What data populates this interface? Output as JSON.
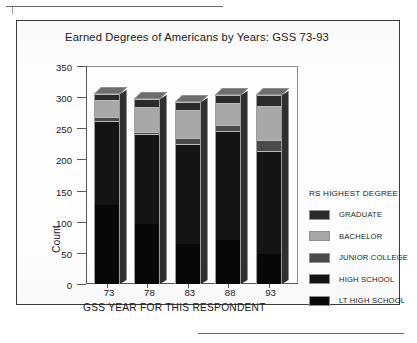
{
  "page": {
    "rules": {
      "top_rule": "horizontal-rule",
      "bottom_rule": "horizontal-rule"
    }
  },
  "figure": {
    "frame": "chart-frame"
  },
  "chart_data": {
    "type": "bar",
    "subtype": "stacked-vertical-3d",
    "title": "Earned Degrees of Americans by Years: GSS 73-93",
    "xlabel": "GSS YEAR FOR THIS RESPONDENT",
    "ylabel": "Count",
    "categories": [
      "73",
      "78",
      "83",
      "88",
      "93"
    ],
    "ylim": [
      0,
      350
    ],
    "yticks": [
      0,
      50,
      100,
      150,
      200,
      250,
      300,
      350
    ],
    "grid": false,
    "legend_title": "RS HIGHEST DEGREE",
    "legend_position": "right",
    "stack_order_bottom_to_top": [
      "LT HIGH SCHOOL",
      "HIGH SCHOOL",
      "JUNIOR COLLEGE",
      "BACHELOR",
      "GRADUATE"
    ],
    "series": [
      {
        "name": "LT HIGH SCHOOL",
        "color": "#070707",
        "values": [
          127,
          97,
          65,
          71,
          48
        ]
      },
      {
        "name": "HIGH SCHOOL",
        "color": "#141414",
        "values": [
          135,
          144,
          160,
          175,
          166
        ]
      },
      {
        "name": "JUNIOR COLLEGE",
        "color": "#4a4a4a",
        "values": [
          6,
          3,
          10,
          9,
          17
        ]
      },
      {
        "name": "BACHELOR",
        "color": "#a8a8a8",
        "values": [
          27,
          40,
          45,
          36,
          55
        ]
      },
      {
        "name": "GRADUATE",
        "color": "#2b2b2b",
        "values": [
          10,
          13,
          13,
          12,
          18
        ]
      }
    ],
    "totals": [
      305,
      297,
      293,
      303,
      304
    ],
    "legend_entries": [
      {
        "label": "GRADUATE",
        "color": "#2b2b2b"
      },
      {
        "label": "BACHELOR",
        "color": "#a8a8a8"
      },
      {
        "label": "JUNIOR COLLEGE",
        "color": "#4a4a4a"
      },
      {
        "label": "HIGH SCHOOL",
        "color": "#141414"
      },
      {
        "label": "LT HIGH SCHOOL",
        "color": "#070707"
      }
    ]
  }
}
